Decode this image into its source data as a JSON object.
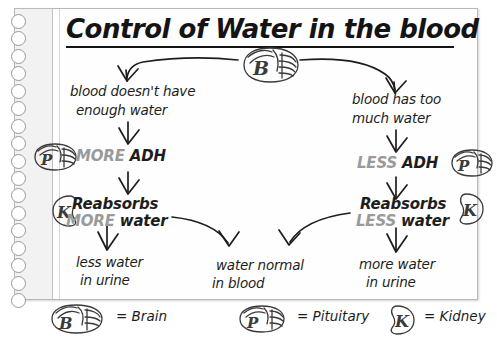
{
  "page": {
    "title": "Control of Water in the blood",
    "binding_holes": 17
  },
  "diagram": {
    "type": "flowchart",
    "center_node": {
      "icon": "brain-icon",
      "letter": "B"
    },
    "left_branch": {
      "step1_line1": "blood doesn't have",
      "step1_line2": "enough water",
      "step2_emphasis": "MORE",
      "step2_rest": "ADH",
      "step2_icon": "pituitary-icon",
      "step2_icon_letter": "P",
      "step3_line1": "Reabsorbs",
      "step3_emphasis": "MORE",
      "step3_rest": "water",
      "step3_icon": "kidney-icon",
      "step3_icon_letter": "K",
      "step4_line1": "less water",
      "step4_line2": "in urine"
    },
    "right_branch": {
      "step1_line1": "blood has too",
      "step1_line2": "much water",
      "step2_emphasis": "LESS",
      "step2_rest": "ADH",
      "step2_icon": "pituitary-icon",
      "step2_icon_letter": "P",
      "step3_line1": "Reabsorbs",
      "step3_emphasis": "LESS",
      "step3_rest": "water",
      "step3_icon": "kidney-icon",
      "step3_icon_letter": "K",
      "step4_line1": "more water",
      "step4_line2": "in urine"
    },
    "outcome": {
      "line1": "water normal",
      "line2": "in blood"
    }
  },
  "legend": {
    "items": [
      {
        "icon": "brain-icon",
        "letter": "B",
        "label": "= Brain"
      },
      {
        "icon": "pituitary-icon",
        "letter": "P",
        "label": "= Pituitary"
      },
      {
        "icon": "kidney-icon",
        "letter": "K",
        "label": "= Kidney"
      }
    ]
  },
  "colors": {
    "ink": "#1d1d1d",
    "emphasis_grey": "#9a9a9a",
    "paper": "#fefefe",
    "binding": "#f2f2f2"
  }
}
